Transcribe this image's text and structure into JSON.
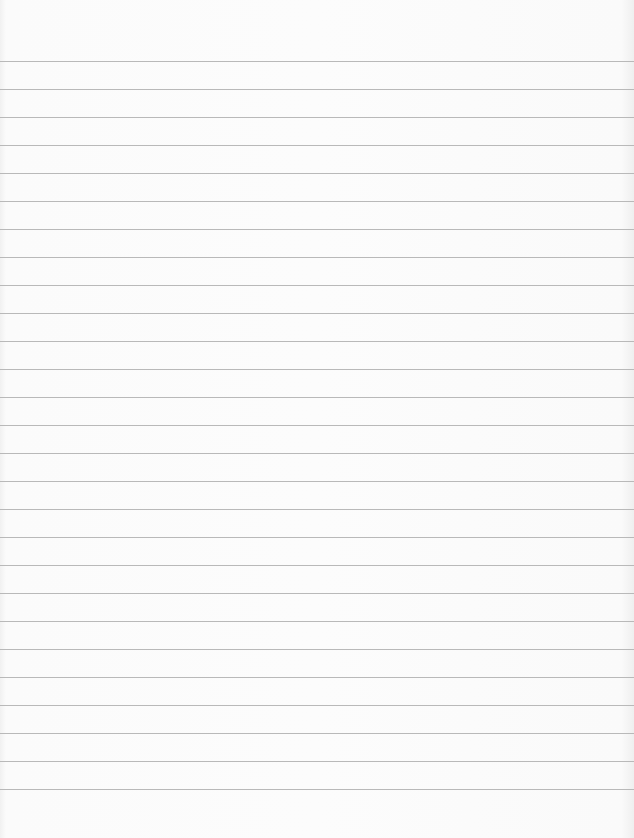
{
  "page": {
    "type": "lined-paper",
    "background_color": "#fcfcfc",
    "rule_color": "#b9b9b9",
    "first_rule_y": 61,
    "rule_spacing": 28,
    "rule_count": 27
  }
}
